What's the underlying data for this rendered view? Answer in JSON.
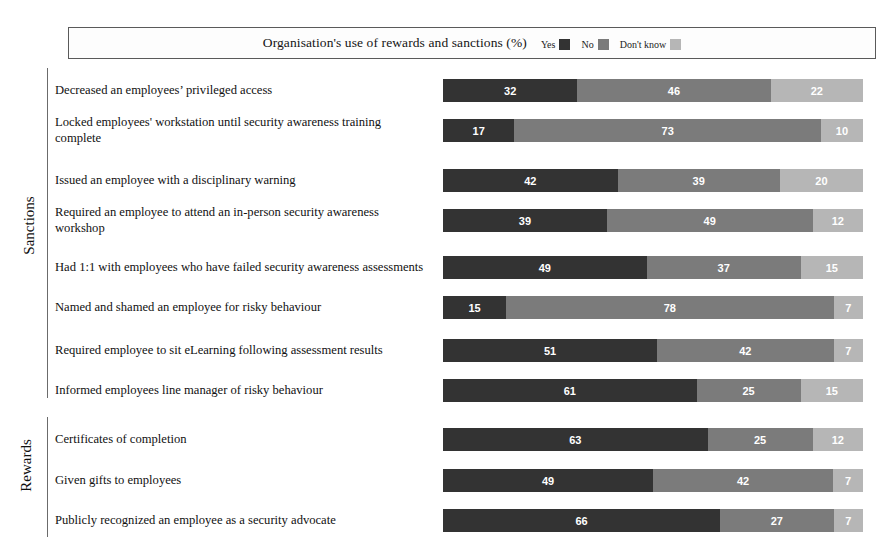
{
  "chart_data": {
    "type": "bar",
    "subtype": "stacked-horizontal-100",
    "title": "Organisation's use of rewards and sanctions (%)",
    "xlabel": "",
    "ylabel": "",
    "xlim": [
      0,
      100
    ],
    "grid": false,
    "legend_position": "top-right-inline",
    "series": [
      {
        "name": "Yes",
        "color": "#333333"
      },
      {
        "name": "No",
        "color": "#7b7b7b"
      },
      {
        "name": "Don't know",
        "color": "#b6b6b6"
      }
    ],
    "groups": [
      {
        "name": "Sanctions",
        "categories": [
          "Decreased an employees’ privileged access",
          "Locked employees' workstation until security awareness training complete",
          "Issued an employee with a disciplinary warning",
          "Required an employee to attend an in-person security awareness workshop",
          "Had 1:1 with employees who have failed security awareness assessments",
          "Named and shamed an employee for risky behaviour",
          "Required employee to sit eLearning following assessment results",
          "Informed employees line manager of risky behaviour"
        ],
        "values": [
          [
            32,
            46,
            22
          ],
          [
            17,
            73,
            10
          ],
          [
            42,
            39,
            20
          ],
          [
            39,
            49,
            12
          ],
          [
            49,
            37,
            15
          ],
          [
            15,
            78,
            7
          ],
          [
            51,
            42,
            7
          ],
          [
            61,
            25,
            15
          ]
        ]
      },
      {
        "name": "Rewards",
        "categories": [
          "Certificates of completion",
          "Given gifts to employees",
          "Publicly recognized an employee as a security advocate"
        ],
        "values": [
          [
            63,
            25,
            12
          ],
          [
            49,
            42,
            7
          ],
          [
            66,
            27,
            7
          ]
        ]
      }
    ]
  },
  "legend": {
    "items": [
      {
        "label": "Yes",
        "color": "#333333"
      },
      {
        "label": "No",
        "color": "#7b7b7b"
      },
      {
        "label": "Don't know",
        "color": "#b6b6b6"
      }
    ]
  },
  "axis": {
    "group_labels": [
      "Sanctions",
      "Rewards"
    ]
  },
  "colors": {
    "yes": "#333333",
    "no": "#7b7b7b",
    "dont_know": "#b6b6b6",
    "box_border": "#5a5a5a",
    "spine": "#6b6b6b",
    "text": "#111111",
    "value_text": "#ffffff",
    "background": "#ffffff"
  }
}
